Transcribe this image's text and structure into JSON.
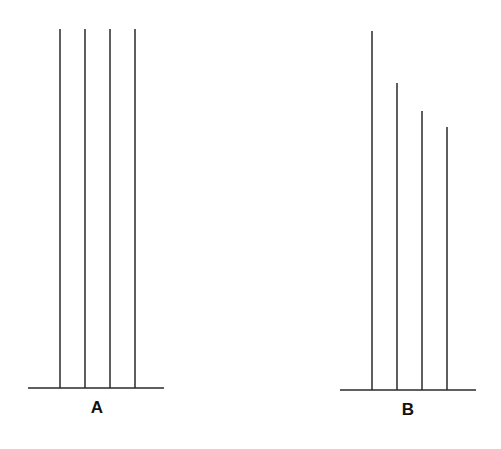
{
  "figure": {
    "panels": [
      {
        "label": "A",
        "baseline": {
          "x1": 28,
          "x2": 164,
          "y": 388
        },
        "label_pos": {
          "x": 97,
          "y": 413
        },
        "lines": [
          {
            "x": 60,
            "top": 29
          },
          {
            "x": 85,
            "top": 29
          },
          {
            "x": 110,
            "top": 29
          },
          {
            "x": 135,
            "top": 29
          }
        ]
      },
      {
        "label": "B",
        "baseline": {
          "x1": 340,
          "x2": 476,
          "y": 390
        },
        "label_pos": {
          "x": 408,
          "y": 415
        },
        "lines": [
          {
            "x": 372,
            "top": 31
          },
          {
            "x": 397,
            "top": 83
          },
          {
            "x": 422,
            "top": 111
          },
          {
            "x": 447,
            "top": 127
          }
        ]
      }
    ],
    "stroke_color": "#2a2a2a",
    "background": "#ffffff"
  }
}
